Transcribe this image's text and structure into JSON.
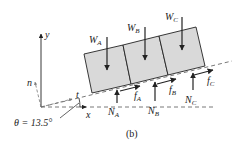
{
  "figure": {
    "caption": "(b)",
    "angle_label": "θ = 13.5°",
    "colors": {
      "block_fill": "#d9d9d9",
      "stroke": "#222222",
      "dashed": "#555555"
    }
  },
  "axes": {
    "x_label": "x",
    "y_label": "y",
    "t_label": "t",
    "n_label": "n"
  },
  "blocks": [
    {
      "id": "A",
      "weight_label": "W",
      "weight_sub": "A",
      "normal_label": "N",
      "normal_sub": "A",
      "friction_label": "f",
      "friction_sub": "A"
    },
    {
      "id": "B",
      "weight_label": "W",
      "weight_sub": "B",
      "normal_label": "N",
      "normal_sub": "B",
      "friction_label": "f",
      "friction_sub": "B"
    },
    {
      "id": "C",
      "weight_label": "W",
      "weight_sub": "C",
      "normal_label": "N",
      "normal_sub": "C",
      "friction_label": "f",
      "friction_sub": "C"
    }
  ]
}
